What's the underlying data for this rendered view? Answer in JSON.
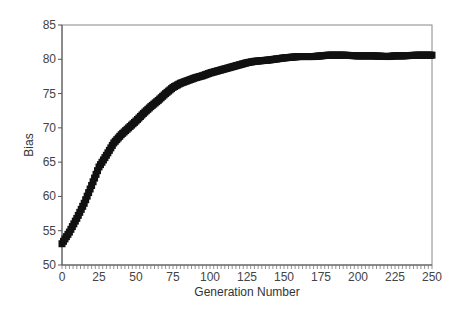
{
  "chart_data": {
    "type": "scatter",
    "title": "",
    "xlabel": "Generation Number",
    "ylabel": "Bias",
    "xlim": [
      0,
      250
    ],
    "ylim": [
      50,
      85
    ],
    "x_ticks": [
      0,
      25,
      50,
      75,
      100,
      125,
      150,
      175,
      200,
      225,
      250
    ],
    "y_ticks": [
      50,
      55,
      60,
      65,
      70,
      75,
      80,
      85
    ],
    "grid": false,
    "legend": null,
    "marker": "square",
    "marker_color": "#111111",
    "series": [
      {
        "name": "Bias",
        "x": [
          0,
          2,
          5,
          10,
          15,
          20,
          25,
          30,
          35,
          40,
          45,
          50,
          55,
          60,
          65,
          70,
          75,
          80,
          85,
          90,
          95,
          100,
          110,
          120,
          125,
          130,
          140,
          150,
          160,
          170,
          175,
          180,
          190,
          200,
          210,
          220,
          225,
          230,
          240,
          250
        ],
        "y": [
          53.1,
          53.8,
          54.8,
          56.8,
          59.0,
          61.6,
          64.3,
          66.0,
          67.8,
          69.0,
          70.0,
          71.0,
          72.1,
          73.1,
          74.0,
          75.0,
          75.9,
          76.5,
          76.9,
          77.3,
          77.6,
          78.0,
          78.6,
          79.2,
          79.5,
          79.7,
          79.9,
          80.2,
          80.4,
          80.4,
          80.5,
          80.6,
          80.6,
          80.5,
          80.5,
          80.4,
          80.5,
          80.5,
          80.6,
          80.6
        ]
      }
    ]
  },
  "axes": {
    "x_title": "Generation Number",
    "y_title": "Bias",
    "x_tick_labels": [
      "0",
      "25",
      "50",
      "75",
      "100",
      "125",
      "150",
      "175",
      "200",
      "225",
      "250"
    ],
    "y_tick_labels": [
      "50",
      "55",
      "60",
      "65",
      "70",
      "75",
      "80",
      "85"
    ]
  }
}
